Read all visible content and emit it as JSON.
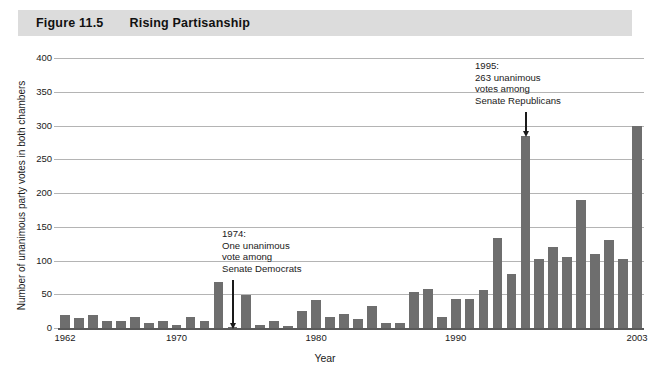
{
  "figure": {
    "number": "Figure 11.5",
    "title": "Rising Partisanship"
  },
  "colors": {
    "bar": "#6e6e6e",
    "header_band": "#dcdcdc",
    "gridline": "#b4b4b4",
    "axis": "#5a5a5a",
    "text": "#1a1a1a"
  },
  "annotations": [
    {
      "id": "ann-1974",
      "text": "1974:\nOne unanimous\nvote among\nSenate Democrats",
      "year": 1974,
      "value": 1
    },
    {
      "id": "ann-1995",
      "text": "1995:\n263 unanimous\nvotes among\nSenate Republicans",
      "year": 1995,
      "value": 285
    }
  ],
  "chart_data": {
    "type": "bar",
    "title": "Rising Partisanship",
    "xlabel": "Year",
    "ylabel": "Number of unanimous party votes in both chambers",
    "ylim": [
      0,
      400
    ],
    "yticks": [
      0,
      50,
      100,
      150,
      200,
      250,
      300,
      350,
      400
    ],
    "xticks": [
      1962,
      1970,
      1980,
      1990,
      2003
    ],
    "grid": true,
    "legend": "none",
    "xlim": [
      1962,
      2003
    ],
    "categories": [
      1962,
      1963,
      1964,
      1965,
      1966,
      1967,
      1968,
      1969,
      1970,
      1971,
      1972,
      1973,
      1974,
      1975,
      1976,
      1977,
      1978,
      1979,
      1980,
      1981,
      1982,
      1983,
      1984,
      1985,
      1986,
      1987,
      1988,
      1989,
      1990,
      1991,
      1992,
      1993,
      1994,
      1995,
      1996,
      1997,
      1998,
      1999,
      2000,
      2001,
      2002,
      2003
    ],
    "values": [
      20,
      15,
      20,
      10,
      11,
      17,
      8,
      11,
      5,
      16,
      11,
      68,
      1,
      49,
      5,
      11,
      3,
      25,
      42,
      16,
      21,
      13,
      33,
      7,
      8,
      54,
      58,
      16,
      43,
      43,
      57,
      133,
      80,
      285,
      102,
      120,
      105,
      190,
      110,
      130,
      102,
      300
    ]
  }
}
